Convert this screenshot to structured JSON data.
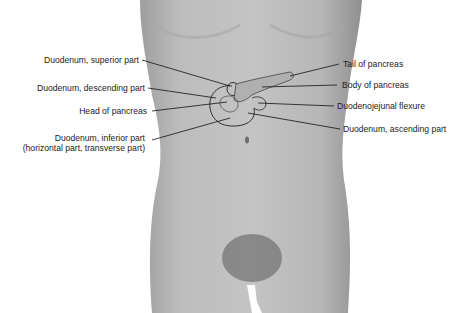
{
  "figure": {
    "colors": {
      "background": "#ffffff",
      "body": "#b9b9b9",
      "body_shadow": "#9a9a9a",
      "leader": "#111111",
      "text": "#222222"
    }
  },
  "labels": {
    "left": [
      {
        "id": "duodenum-superior",
        "text": "Duodenum, superior part"
      },
      {
        "id": "duodenum-descending",
        "text": "Duodenum, descending part"
      },
      {
        "id": "head-of-pancreas",
        "text": "Head of pancreas"
      },
      {
        "id": "duodenum-inferior",
        "text": "Duodenum, inferior part"
      },
      {
        "id": "duodenum-inferior-alt",
        "text": "(horizontal part, transverse part)"
      }
    ],
    "right": [
      {
        "id": "tail-of-pancreas",
        "text": "Tail of pancreas"
      },
      {
        "id": "body-of-pancreas",
        "text": "Body of pancreas"
      },
      {
        "id": "duodenojejunal-flexure",
        "text": "Duodenojejunal flexure"
      },
      {
        "id": "duodenum-ascending",
        "text": "Duodenum, ascending part"
      }
    ]
  }
}
